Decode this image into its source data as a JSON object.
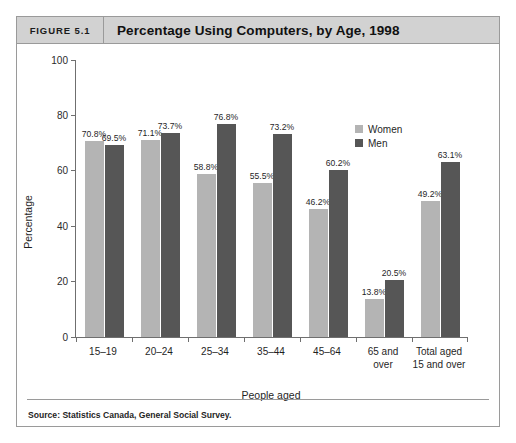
{
  "figure": {
    "number_label": "FIGURE 5.1",
    "title": "Percentage Using Computers, by Age, 1998",
    "source": "Source: Statistics Canada, General Social Survey."
  },
  "legend": {
    "women_label": "Women",
    "men_label": "Men",
    "women_color": "#b4b4b4",
    "men_color": "#565656"
  },
  "chart_data": {
    "type": "bar",
    "title": "Percentage Using Computers, by Age, 1998",
    "xlabel": "People aged",
    "ylabel": "Percentage",
    "ylim": [
      0,
      100
    ],
    "yticks": [
      0,
      20,
      40,
      60,
      80,
      100
    ],
    "ytick_labels": [
      "0",
      "20",
      "40",
      "60",
      "80",
      "100"
    ],
    "grid": false,
    "legend_position": "top-right",
    "categories": [
      "15–19",
      "20–24",
      "25–34",
      "35–44",
      "45–64",
      "65 and over",
      "Total aged 15 and over"
    ],
    "category_lines": [
      [
        "15–19"
      ],
      [
        "20–24"
      ],
      [
        "25–34"
      ],
      [
        "35–44"
      ],
      [
        "45–64"
      ],
      [
        "65 and",
        "over"
      ],
      [
        "Total aged",
        "15 and over"
      ]
    ],
    "series": [
      {
        "name": "Women",
        "color": "#b4b4b4",
        "values": [
          70.8,
          71.1,
          58.8,
          55.5,
          46.2,
          13.8,
          49.2
        ],
        "labels": [
          "70.8%",
          "71.1%",
          "58.8%",
          "55.5%",
          "46.2%",
          "13.8%",
          "49.2%"
        ]
      },
      {
        "name": "Men",
        "color": "#565656",
        "values": [
          69.5,
          73.7,
          76.8,
          73.2,
          60.2,
          20.5,
          63.1
        ],
        "labels": [
          "69.5%",
          "73.7%",
          "76.8%",
          "73.2%",
          "60.2%",
          "20.5%",
          "63.1%"
        ]
      }
    ]
  }
}
